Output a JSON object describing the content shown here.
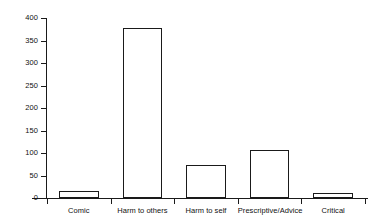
{
  "chart_data": {
    "type": "bar",
    "title": "",
    "subtitle": "",
    "xlabel": "",
    "ylabel": "",
    "categories": [
      "Comic",
      "Harm to others",
      "Harm to self",
      "Prescriptive/Advice",
      "Critical"
    ],
    "values": [
      15,
      378,
      73,
      107,
      11
    ],
    "series": [
      {
        "name": "Count",
        "values": [
          15,
          378,
          73,
          107,
          11
        ]
      }
    ],
    "ylim": [
      0,
      400
    ],
    "yticks": [
      0,
      50,
      100,
      150,
      200,
      250,
      300,
      350,
      400
    ],
    "ytick_labels": [
      "0",
      "50",
      "100",
      "150",
      "200",
      "250",
      "300",
      "350",
      "400"
    ],
    "grid": false,
    "legend": false,
    "legend_position": "none",
    "bar_fill_color": "#ffffff",
    "bar_edge_color": "#1a1a1a",
    "axis_color": "#1a1a1a",
    "background_color": "#ffffff"
  }
}
